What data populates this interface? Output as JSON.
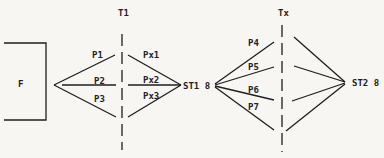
{
  "diagram": {
    "colors": {
      "background": "#f7f6f3",
      "ink": "#1e1e1e"
    },
    "source_box": {
      "label": "F"
    },
    "dividers": [
      {
        "id": "t1",
        "label": "T1"
      },
      {
        "id": "tx",
        "label": "Tx"
      }
    ],
    "stations": [
      {
        "id": "st1",
        "label": "ST1 8"
      },
      {
        "id": "st2",
        "label": "ST2 8"
      }
    ],
    "paths_left": [
      {
        "label": "P1"
      },
      {
        "label": "P2"
      },
      {
        "label": "P3"
      }
    ],
    "paths_x": [
      {
        "label": "Px1"
      },
      {
        "label": "Px2"
      },
      {
        "label": "Px3"
      }
    ],
    "paths_right": [
      {
        "label": "P4"
      },
      {
        "label": "P5"
      },
      {
        "label": "P6"
      },
      {
        "label": "P7"
      }
    ]
  }
}
